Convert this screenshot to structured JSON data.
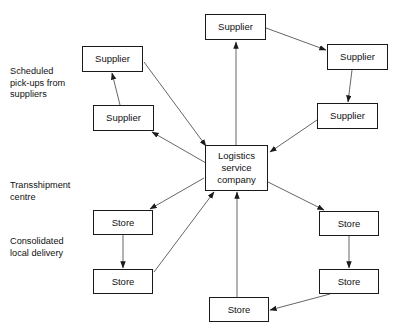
{
  "diagram": {
    "stroke_color": "#1a1a1a",
    "text_color": "#111111",
    "background": "#ffffff",
    "hub": {
      "line1": "Logistics",
      "line2": "service",
      "line3": "company"
    },
    "margin_labels": [
      {
        "id": "scheduled-pickups",
        "text": "Scheduled\npick-ups from\nsuppliers"
      },
      {
        "id": "transshipment-centre",
        "text": "Transshipment\ncentre"
      },
      {
        "id": "consolidated-delivery",
        "text": "Consolidated\nlocal delivery"
      }
    ],
    "nodes": [
      {
        "id": "supplier-top",
        "label": "Supplier"
      },
      {
        "id": "supplier-upper-left",
        "label": "Supplier"
      },
      {
        "id": "supplier-lower-left",
        "label": "Supplier"
      },
      {
        "id": "supplier-upper-right",
        "label": "Supplier"
      },
      {
        "id": "supplier-lower-right",
        "label": "Supplier"
      },
      {
        "id": "store-upper-left",
        "label": "Store"
      },
      {
        "id": "store-lower-left",
        "label": "Store"
      },
      {
        "id": "store-upper-right",
        "label": "Store"
      },
      {
        "id": "store-lower-right",
        "label": "Store"
      },
      {
        "id": "store-bottom-centre",
        "label": "Store"
      }
    ],
    "edges": [
      {
        "from": "supplier-top",
        "to": "hub",
        "direction": "into-hub"
      },
      {
        "from": "supplier-upper-left",
        "to": "hub",
        "direction": "into-hub"
      },
      {
        "from": "supplier-lower-left",
        "to": "hub",
        "direction": "into-hub"
      },
      {
        "from": "supplier-lower-right",
        "to": "hub",
        "direction": "into-hub"
      },
      {
        "from": "store-bottom-centre",
        "to": "hub",
        "direction": "into-hub"
      },
      {
        "from": "store-lower-left",
        "to": "hub",
        "direction": "into-hub"
      },
      {
        "from": "hub",
        "to": "supplier-top",
        "direction": "out-of-hub"
      },
      {
        "from": "hub",
        "to": "supplier-upper-right",
        "direction": "out-of-hub"
      },
      {
        "from": "hub",
        "to": "supplier-lower-left",
        "direction": "out-of-hub"
      },
      {
        "from": "hub",
        "to": "store-upper-left",
        "direction": "out-of-hub"
      },
      {
        "from": "hub",
        "to": "store-upper-right",
        "direction": "out-of-hub"
      },
      {
        "from": "supplier-upper-right",
        "to": "supplier-lower-right",
        "direction": "chain"
      },
      {
        "from": "supplier-lower-left",
        "to": "supplier-upper-left",
        "direction": "chain"
      },
      {
        "from": "store-upper-left",
        "to": "store-lower-left",
        "direction": "chain"
      },
      {
        "from": "store-upper-right",
        "to": "store-lower-right",
        "direction": "chain"
      },
      {
        "from": "store-lower-right",
        "to": "store-bottom-centre",
        "direction": "chain"
      }
    ]
  }
}
